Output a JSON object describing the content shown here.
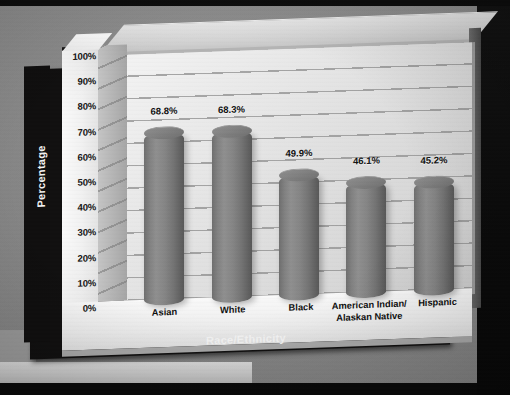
{
  "chart_data": {
    "type": "bar",
    "title": "",
    "subtitle": "",
    "xlabel": "Race/Ethnicity",
    "ylabel": "Percentage",
    "categories": [
      "Asian",
      "White",
      "Black",
      "American Indian/\nAlaskan Native",
      "Hispanic"
    ],
    "values": [
      68.8,
      68.3,
      49.9,
      46.1,
      45.2
    ],
    "data_labels": [
      "68.8%",
      "68.3%",
      "49.9%",
      "46.1%",
      "45.2%"
    ],
    "ylim": [
      0,
      100
    ],
    "ytick_values": [
      0,
      10,
      20,
      30,
      40,
      50,
      60,
      70,
      80,
      90,
      100
    ],
    "ytick_labels": [
      "0%",
      "10%",
      "20%",
      "30%",
      "40%",
      "50%",
      "60%",
      "70%",
      "80%",
      "90%",
      "100%"
    ],
    "grid": "horizontal",
    "legend": "none",
    "style": "3d-cylinder",
    "series": [
      {
        "name": "Percentage",
        "values": [
          68.8,
          68.3,
          49.9,
          46.1,
          45.2
        ]
      }
    ]
  },
  "colors": {
    "background": "#8a8a8a",
    "frame": "#111010",
    "plot_wall": "#e8e8e8",
    "bar": "#7d7d7d",
    "bar_highlight": "#8f8f8f",
    "bar_shadow": "#585858",
    "text": "#0f0f0f",
    "axis_title_text": "#f4f4f4",
    "gridline": "#8e8e8e"
  },
  "bars": [
    {
      "label": "Asian",
      "value": 68.8,
      "data_label": "68.8%",
      "center_pct": 11,
      "label_lines": [
        "Asian"
      ]
    },
    {
      "label": "White",
      "value": 68.3,
      "data_label": "68.3%",
      "center_pct": 30.5,
      "label_lines": [
        "White"
      ]
    },
    {
      "label": "Black",
      "value": 49.9,
      "data_label": "49.9%",
      "center_pct": 50,
      "label_lines": [
        "Black"
      ]
    },
    {
      "label": "American Indian/ Alaskan Native",
      "value": 46.1,
      "data_label": "46.1%",
      "center_pct": 69.5,
      "label_lines": [
        "American Indian/",
        "Alaskan Native"
      ]
    },
    {
      "label": "Hispanic",
      "value": 45.2,
      "data_label": "45.2%",
      "center_pct": 89,
      "label_lines": [
        "Hispanic"
      ]
    }
  ]
}
